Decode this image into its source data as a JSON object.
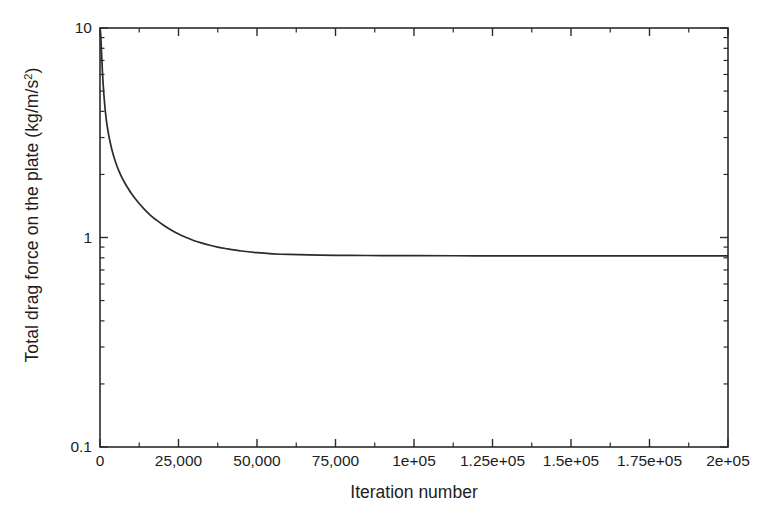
{
  "chart_data": {
    "type": "line",
    "title": "",
    "xlabel": "Iteration number",
    "ylabel": "Total drag force on the plate (kg/m/s²)",
    "ylabel_plain": "Total drag force on the plate (kg/m/s2)",
    "yscale": "log",
    "xscale": "linear",
    "xlim": [
      0,
      200000
    ],
    "ylim": [
      0.1,
      10
    ],
    "grid": false,
    "legend": null,
    "legend_position": "none",
    "frame": "box",
    "line_color": "#2b2b2b",
    "background_color": "#ffffff",
    "axis_color": "#2b2b2b",
    "xticks": [
      0,
      25000,
      50000,
      75000,
      100000,
      125000,
      150000,
      175000,
      200000
    ],
    "xtick_labels": [
      "0",
      "25,000",
      "50,000",
      "75,000",
      "1e+05",
      "1.25e+05",
      "1.5e+05",
      "1.75e+05",
      "2e+05"
    ],
    "x_minor_ticks": [
      12500,
      37500,
      62500,
      87500,
      112500,
      137500,
      162500,
      187500
    ],
    "yticks": [
      0.1,
      1,
      10
    ],
    "ytick_labels": [
      "0.1",
      "1",
      "10"
    ],
    "y_minor_ticks": [
      0.2,
      0.3,
      0.4,
      0.5,
      0.6,
      0.7,
      0.8,
      0.9,
      2,
      3,
      4,
      5,
      6,
      7,
      8,
      9
    ],
    "series": [
      {
        "name": "Total drag force on the plate",
        "x": [
          0,
          250,
          500,
          750,
          1000,
          1500,
          2000,
          2500,
          3000,
          4000,
          5000,
          6000,
          7000,
          8000,
          9000,
          10000,
          12000,
          14000,
          16000,
          18000,
          20000,
          22500,
          25000,
          27500,
          30000,
          32500,
          35000,
          37500,
          40000,
          45000,
          50000,
          55000,
          60000,
          70000,
          80000,
          90000,
          100000,
          120000,
          140000,
          160000,
          180000,
          200000
        ],
        "y": [
          10.0,
          9.2,
          7.6,
          6.3,
          5.4,
          4.3,
          3.65,
          3.25,
          2.96,
          2.55,
          2.28,
          2.08,
          1.93,
          1.81,
          1.71,
          1.62,
          1.48,
          1.37,
          1.28,
          1.21,
          1.15,
          1.09,
          1.04,
          1.0,
          0.965,
          0.94,
          0.918,
          0.9,
          0.886,
          0.862,
          0.846,
          0.836,
          0.83,
          0.824,
          0.821,
          0.82,
          0.819,
          0.818,
          0.818,
          0.818,
          0.818,
          0.818
        ]
      }
    ],
    "annotations": []
  },
  "axes": {
    "plot_left_px": 100,
    "plot_right_px": 728,
    "plot_top_px": 28,
    "plot_bottom_px": 447
  }
}
